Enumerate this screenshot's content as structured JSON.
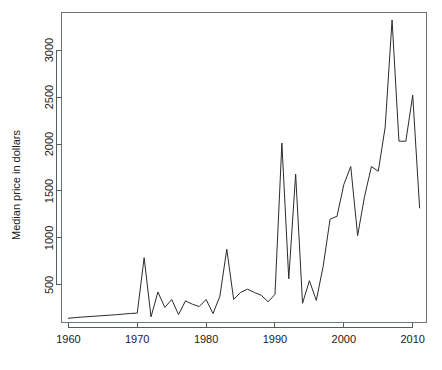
{
  "chart_data": {
    "type": "line",
    "title": "",
    "xlabel": "",
    "ylabel": "Median price in dollars",
    "xlim": [
      1959,
      2012
    ],
    "ylim": [
      100,
      3400
    ],
    "grid": false,
    "legend": "none",
    "xticks": [
      1960,
      1970,
      1980,
      1990,
      2000,
      2010
    ],
    "xtick_labels": [
      "1960",
      "1970",
      "1980",
      "1990",
      "2000",
      "2010"
    ],
    "yticks": [
      500,
      1000,
      1500,
      2000,
      2500,
      3000
    ],
    "ytick_labels": [
      "500",
      "1000",
      "1500",
      "2000",
      "2500",
      "3000"
    ],
    "series": [
      {
        "name": "Median price",
        "line_color": "#2b2b2b",
        "x": [
          1960,
          1961,
          1962,
          1963,
          1964,
          1965,
          1966,
          1967,
          1968,
          1969,
          1970,
          1971,
          1972,
          1973,
          1974,
          1975,
          1976,
          1977,
          1978,
          1979,
          1980,
          1981,
          1982,
          1983,
          1984,
          1985,
          1986,
          1987,
          1988,
          1989,
          1990,
          1991,
          1992,
          1993,
          1994,
          1995,
          1996,
          1997,
          1998,
          1999,
          2000,
          2001,
          2002,
          2003,
          2004,
          2005,
          2006,
          2007,
          2008,
          2009,
          2010,
          2011
        ],
        "y": [
          145,
          152,
          158,
          163,
          168,
          173,
          178,
          183,
          190,
          196,
          200,
          790,
          160,
          425,
          260,
          345,
          185,
          330,
          295,
          270,
          345,
          195,
          380,
          880,
          345,
          420,
          455,
          420,
          390,
          320,
          400,
          2010,
          565,
          1680,
          305,
          545,
          335,
          700,
          1200,
          1230,
          1570,
          1760,
          1025,
          1440,
          1760,
          1710,
          2180,
          3320,
          2030,
          2030,
          2520,
          1320
        ]
      }
    ]
  },
  "axis": {
    "y_title": "Median price in dollars"
  }
}
